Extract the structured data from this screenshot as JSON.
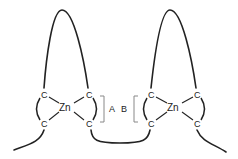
{
  "diagram": {
    "type": "chemical-structure",
    "colors": {
      "line": "#222222",
      "bracket": "#888888",
      "background": "#ffffff"
    },
    "left_complex": {
      "center": "Zn",
      "atoms": [
        "C",
        "C",
        "C",
        "C"
      ]
    },
    "right_complex": {
      "center": "Zn",
      "atoms": [
        "C",
        "C",
        "C",
        "C"
      ]
    },
    "labels": {
      "a": "A",
      "b": "B"
    }
  }
}
